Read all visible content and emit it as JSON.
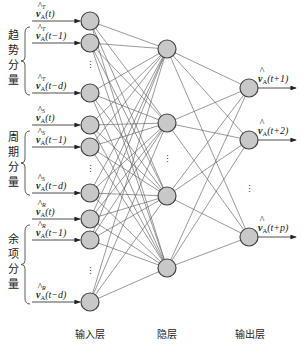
{
  "diagram": {
    "type": "neural-network",
    "groups": [
      {
        "label_chars": [
          "趋",
          "势",
          "分",
          "量"
        ],
        "superscript": "T",
        "inputs": [
          "(t)",
          "(t−1)",
          "(t−d)"
        ]
      },
      {
        "label_chars": [
          "周",
          "期",
          "分",
          "量"
        ],
        "superscript": "S",
        "inputs": [
          "(t)",
          "(t−1)",
          "(t−d)"
        ]
      },
      {
        "label_chars": [
          "余",
          "项",
          "分",
          "量"
        ],
        "superscript": "R",
        "inputs": [
          "(t)",
          "(t−1)",
          "(t−d)"
        ]
      }
    ],
    "variable": "v",
    "subscript": "A",
    "outputs": [
      "(t+1)",
      "(t+2)",
      "(t+p)"
    ],
    "layers": {
      "input": "输入层",
      "hidden": "隐层",
      "output": "输出层"
    },
    "ellipsis": "⋮",
    "colors": {
      "node_fill": "#c8c8c8",
      "node_stroke": "#444444",
      "edge": "#555555"
    }
  }
}
